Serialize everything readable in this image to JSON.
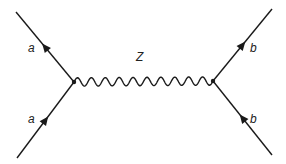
{
  "diagram": {
    "type": "feynman",
    "propagator": {
      "label": "Z",
      "style": "wavy"
    },
    "vertices": [
      {
        "id": "v1",
        "x": 74,
        "y": 82
      },
      {
        "id": "v2",
        "x": 213,
        "y": 81
      }
    ],
    "fermions": [
      {
        "id": "a-top",
        "label": "a",
        "from": [
          74,
          82
        ],
        "to": [
          16,
          12
        ],
        "arrow": "toward-end"
      },
      {
        "id": "a-bottom",
        "label": "a",
        "from": [
          17,
          158
        ],
        "to": [
          74,
          82
        ],
        "arrow": "toward-end"
      },
      {
        "id": "b-top",
        "label": "b",
        "from": [
          213,
          81
        ],
        "to": [
          272,
          9
        ],
        "arrow": "toward-end"
      },
      {
        "id": "b-bottom",
        "label": "b",
        "from": [
          272,
          155
        ],
        "to": [
          213,
          81
        ],
        "arrow": "toward-end"
      }
    ],
    "labels": {
      "a_top": "a",
      "a_bottom": "a",
      "z": "Z",
      "b_top": "b",
      "b_bottom": "b"
    },
    "colors": {
      "line": "#1a1a1a",
      "background": "#ffffff"
    }
  }
}
